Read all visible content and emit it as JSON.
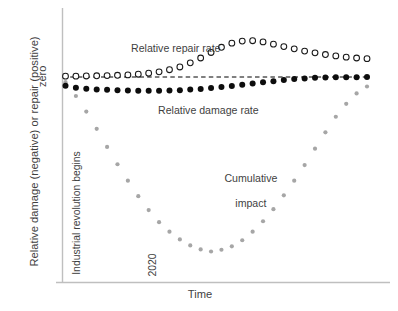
{
  "chart_data": {
    "type": "scatter",
    "title": "",
    "xlabel": "Time",
    "ylabel": "Relative damage (negative) or repair (positive)",
    "ytick_labels": [
      "zero"
    ],
    "ylim": [
      -1.05,
      0.28
    ],
    "xlim": [
      0,
      30
    ],
    "grid": false,
    "legend": "none (inline annotations)",
    "zero_line": {
      "value": 0,
      "style": "dashed",
      "color": "#000000"
    },
    "annotations": [
      {
        "name": "repair-series-label",
        "text": "Relative repair rate"
      },
      {
        "name": "damage-series-label",
        "text": "Relative damage rate"
      },
      {
        "name": "cumulative-series-label",
        "text": "Cumulative\nimpact"
      },
      {
        "name": "industrial-revolution-marker",
        "text": "Industrial revolution begins"
      },
      {
        "name": "year-marker",
        "text": "2020"
      }
    ],
    "annotation_lines": {
      "cumulative_line1": "Cumulative",
      "cumulative_line2": "impact"
    },
    "x": [
      0,
      1,
      2,
      3,
      4,
      5,
      6,
      7,
      8,
      9,
      10,
      11,
      12,
      13,
      14,
      15,
      16,
      17,
      18,
      19,
      20,
      21,
      22,
      23,
      24,
      25,
      26,
      27,
      28,
      29
    ],
    "series": [
      {
        "name": "Relative repair rate",
        "marker": "open-circle",
        "color": "#1a1a1a",
        "values": [
          0.005,
          0.005,
          0.006,
          0.007,
          0.008,
          0.01,
          0.012,
          0.016,
          0.022,
          0.03,
          0.042,
          0.058,
          0.082,
          0.11,
          0.142,
          0.172,
          0.196,
          0.208,
          0.21,
          0.203,
          0.19,
          0.176,
          0.163,
          0.15,
          0.14,
          0.13,
          0.122,
          0.115,
          0.11,
          0.106
        ]
      },
      {
        "name": "Relative damage rate",
        "marker": "filled-circle",
        "color": "#0d0d0d",
        "values": [
          -0.05,
          -0.062,
          -0.068,
          -0.072,
          -0.074,
          -0.076,
          -0.078,
          -0.079,
          -0.08,
          -0.079,
          -0.078,
          -0.076,
          -0.073,
          -0.069,
          -0.064,
          -0.058,
          -0.052,
          -0.045,
          -0.038,
          -0.031,
          -0.024,
          -0.018,
          -0.012,
          -0.008,
          -0.005,
          -0.003,
          -0.002,
          -0.001,
          -0.001,
          0.0
        ]
      },
      {
        "name": "Cumulative impact",
        "marker": "small-filled-circle",
        "color": "#a6a6a6",
        "values": [
          -0.03,
          -0.11,
          -0.2,
          -0.3,
          -0.405,
          -0.505,
          -0.6,
          -0.69,
          -0.77,
          -0.84,
          -0.895,
          -0.94,
          -0.975,
          -0.998,
          -1.01,
          -1.0,
          -0.98,
          -0.945,
          -0.895,
          -0.835,
          -0.765,
          -0.685,
          -0.6,
          -0.51,
          -0.415,
          -0.32,
          -0.23,
          -0.155,
          -0.095,
          -0.055
        ]
      }
    ]
  },
  "labels": {
    "y_axis_title": "Relative damage (negative) or repair (positive)",
    "y_tick_zero": "zero",
    "x_axis_title": "Time",
    "industrial": "Industrial revolution begins",
    "year_2020": "2020",
    "repair": "Relative repair rate",
    "damage": "Relative damage rate",
    "cumulative_line1": "Cumulative",
    "cumulative_line2": "impact"
  },
  "colors": {
    "axis": "#bfbfbf",
    "text": "#3f3f3f",
    "repair_marker": "#1a1a1a",
    "damage_marker": "#0d0d0d",
    "cumulative_marker": "#a6a6a6",
    "zero_line": "#000000",
    "background": "#ffffff"
  }
}
